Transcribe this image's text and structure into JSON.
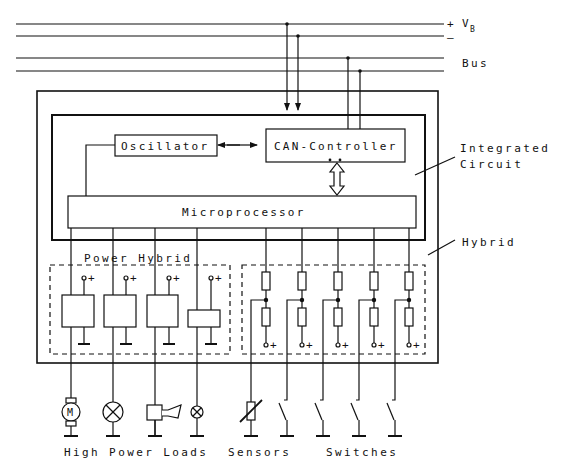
{
  "colors": {
    "stroke": "#111111",
    "background": "#ffffff"
  },
  "supply": {
    "plus": "+",
    "minus": "–",
    "label": "V",
    "subscript": "B"
  },
  "bus": {
    "label": "Bus"
  },
  "blocks": {
    "oscillator": "Oscillator",
    "can_controller": "CAN-Controller",
    "microprocessor": "Microprocessor"
  },
  "regions": {
    "integrated_circuit_line1": "Integrated",
    "integrated_circuit_line2": "Circuit",
    "hybrid": "Hybrid",
    "power_hybrid": "Power Hybrid"
  },
  "terminal_symbol": "+",
  "power_loads": [
    {
      "type": "motor",
      "symbol": "M"
    },
    {
      "type": "lamp"
    },
    {
      "type": "horn"
    },
    {
      "type": "small-lamp"
    }
  ],
  "inputs": [
    {
      "type": "sensor"
    },
    {
      "type": "switch"
    },
    {
      "type": "switch"
    },
    {
      "type": "switch"
    },
    {
      "type": "switch"
    }
  ],
  "bottom_labels": {
    "high_power_loads": "High Power Loads",
    "sensors": "Sensors",
    "switches": "Switches"
  }
}
